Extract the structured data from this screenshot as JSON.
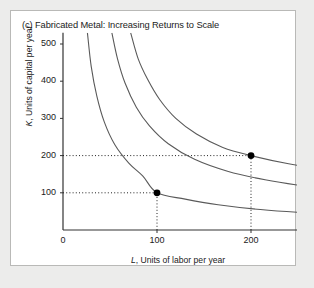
{
  "panel": {
    "title": "(c) Fabricated Metal: Increasing Returns to Scale",
    "background_color": "#ffffff",
    "page_background_color": "#ececeb",
    "border_color": "#b9b9b7"
  },
  "chart_data": {
    "type": "line",
    "title": "(c) Fabricated Metal: Increasing Returns to Scale",
    "xlabel": "L, Units of labor per year",
    "ylabel": "K, Units of capital per year",
    "xlabel_symbol": "L",
    "xlabel_rest": ", Units of labor per year",
    "ylabel_symbol": "K",
    "ylabel_rest": ", Units of capital per year",
    "xlim": [
      0,
      530
    ],
    "ylim": [
      0,
      530
    ],
    "xticks": [
      0,
      100,
      200,
      300,
      400,
      500
    ],
    "yticks": [
      100,
      200,
      300,
      400,
      500
    ],
    "grid": false,
    "legend": "inline-curve-labels",
    "curve_color": "#5a5a5a",
    "point_color": "#000000",
    "series": [
      {
        "name": "q = 100",
        "label": "q = 100",
        "label_symbol": "q",
        "label_rest": " = 100",
        "q": 100,
        "label_x": 430,
        "label_y": 35,
        "points": [
          {
            "x": 26,
            "y": 530
          },
          {
            "x": 30,
            "y": 440
          },
          {
            "x": 36,
            "y": 360
          },
          {
            "x": 44,
            "y": 290
          },
          {
            "x": 55,
            "y": 230
          },
          {
            "x": 70,
            "y": 180
          },
          {
            "x": 85,
            "y": 145
          },
          {
            "x": 100,
            "y": 100
          },
          {
            "x": 130,
            "y": 83
          },
          {
            "x": 165,
            "y": 68
          },
          {
            "x": 210,
            "y": 55
          },
          {
            "x": 265,
            "y": 45
          },
          {
            "x": 330,
            "y": 37
          },
          {
            "x": 400,
            "y": 31
          },
          {
            "x": 470,
            "y": 27
          },
          {
            "x": 530,
            "y": 25
          }
        ]
      },
      {
        "name": "q = 200",
        "label": "q = 200",
        "label_symbol": "q",
        "label_rest": " = 200",
        "q": 200,
        "label_x": 430,
        "label_y": 83,
        "points": [
          {
            "x": 52,
            "y": 530
          },
          {
            "x": 58,
            "y": 460
          },
          {
            "x": 66,
            "y": 395
          },
          {
            "x": 78,
            "y": 330
          },
          {
            "x": 92,
            "y": 280
          },
          {
            "x": 112,
            "y": 232
          },
          {
            "x": 140,
            "y": 190
          },
          {
            "x": 175,
            "y": 158
          },
          {
            "x": 215,
            "y": 135
          },
          {
            "x": 260,
            "y": 117
          },
          {
            "x": 310,
            "y": 102
          },
          {
            "x": 365,
            "y": 91
          },
          {
            "x": 425,
            "y": 82
          },
          {
            "x": 480,
            "y": 76
          },
          {
            "x": 530,
            "y": 72
          }
        ]
      },
      {
        "name": "q = 239",
        "label": "q = 239",
        "label_symbol": "q",
        "label_rest": " = 239",
        "q": 239,
        "label_x": 430,
        "label_y": 135,
        "points": [
          {
            "x": 72,
            "y": 530
          },
          {
            "x": 80,
            "y": 460
          },
          {
            "x": 90,
            "y": 405
          },
          {
            "x": 103,
            "y": 350
          },
          {
            "x": 120,
            "y": 300
          },
          {
            "x": 142,
            "y": 258
          },
          {
            "x": 170,
            "y": 222
          },
          {
            "x": 200,
            "y": 200
          },
          {
            "x": 240,
            "y": 178
          },
          {
            "x": 285,
            "y": 160
          },
          {
            "x": 335,
            "y": 145
          },
          {
            "x": 390,
            "y": 133
          },
          {
            "x": 440,
            "y": 125
          },
          {
            "x": 490,
            "y": 119
          },
          {
            "x": 530,
            "y": 115
          }
        ]
      }
    ],
    "markers": [
      {
        "name": "point-a",
        "x": 100,
        "y": 100,
        "on_series": "q = 100"
      },
      {
        "name": "point-b",
        "x": 200,
        "y": 200,
        "on_series": "q = 239"
      }
    ],
    "guide_lines": [
      {
        "name": "guide-k-100",
        "from": {
          "x": 0,
          "y": 100
        },
        "to": {
          "x": 100,
          "y": 100
        }
      },
      {
        "name": "guide-l-100",
        "from": {
          "x": 100,
          "y": 0
        },
        "to": {
          "x": 100,
          "y": 100
        }
      },
      {
        "name": "guide-k-200",
        "from": {
          "x": 0,
          "y": 200
        },
        "to": {
          "x": 200,
          "y": 200
        }
      },
      {
        "name": "guide-l-200",
        "from": {
          "x": 200,
          "y": 0
        },
        "to": {
          "x": 200,
          "y": 200
        }
      }
    ]
  }
}
